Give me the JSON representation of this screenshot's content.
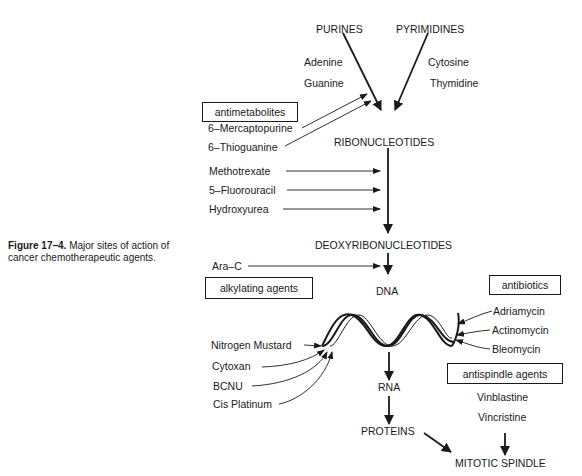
{
  "caption": {
    "figure_label": "Figure 17–4.",
    "text_line1": "Major sites of action of",
    "text_line2": "cancer chemotherapeutic agents."
  },
  "pathway": {
    "purines": "PURINES",
    "pyrimidines": "PYRIMIDINES",
    "purine_bases": [
      "Adenine",
      "Guanine"
    ],
    "pyrimidine_bases": [
      "Cytosine",
      "Thymidine"
    ],
    "ribonucleotides": "RIBONUCLEOTIDES",
    "deoxyribonucleotides": "DEOXYRIBONUCLEOTIDES",
    "dna": "DNA",
    "rna": "RNA",
    "proteins": "PROTEINS",
    "mitotic_spindle": "MITOTIC SPINDLE"
  },
  "groups": {
    "antimetabolites": {
      "label": "antimetabolites",
      "drugs": [
        "6–Mercaptopurine",
        "6–Thioguanine",
        "Methotrexate",
        "5–Fluorouracil",
        "Hydroxyurea",
        "Ara–C"
      ]
    },
    "alkylating_agents": {
      "label": "alkylating agents",
      "drugs": [
        "Nitrogen Mustard",
        "Cytoxan",
        "BCNU",
        "Cis Platinum"
      ]
    },
    "antibiotics": {
      "label": "antibiotics",
      "drugs": [
        "Adriamycin",
        "Actinomycin",
        "Bleomycin"
      ]
    },
    "antispindle_agents": {
      "label": "antispindle agents",
      "drugs": [
        "Vinblastine",
        "Vincristine"
      ]
    }
  },
  "colors": {
    "ink": "#1a1a1a",
    "background": "#ffffff"
  }
}
